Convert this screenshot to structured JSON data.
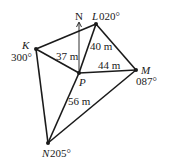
{
  "diagram": {
    "north_label": "N",
    "points": {
      "K": {
        "name": "K",
        "bearing": "300°"
      },
      "L": {
        "name": "L",
        "bearing": "020°"
      },
      "M": {
        "name": "M",
        "bearing": "087°"
      },
      "N": {
        "name": "N",
        "bearing": "205°"
      },
      "P": {
        "name": "P"
      }
    },
    "distances": {
      "PK": "37 m",
      "PL": "40 m",
      "PM": "44 m",
      "PN": "56 m"
    },
    "colors": {
      "line": "#1a1a1a",
      "background": "#ffffff"
    }
  }
}
